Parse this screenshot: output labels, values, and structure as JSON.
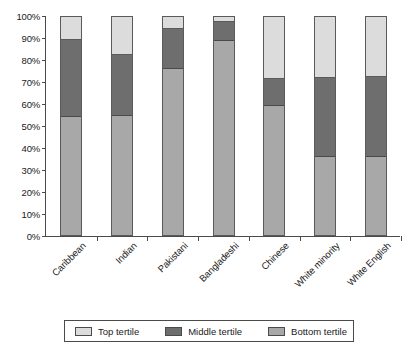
{
  "chart_data": {
    "type": "bar",
    "subtype": "stacked-100-percent",
    "title": "",
    "xlabel": "",
    "ylabel": "",
    "ylim": [
      0,
      100
    ],
    "ytick_labels": [
      "0%",
      "10%",
      "20%",
      "30%",
      "40%",
      "50%",
      "60%",
      "70%",
      "80%",
      "90%",
      "100%"
    ],
    "ytick_values": [
      0,
      10,
      20,
      30,
      40,
      50,
      60,
      70,
      80,
      90,
      100
    ],
    "grid": false,
    "legend_position": "bottom",
    "categories": [
      "Caribbean",
      "Indian",
      "Pakistani",
      "Bangladeshi",
      "Chinese",
      "White minority",
      "White English"
    ],
    "series": [
      {
        "name": "Bottom tertile",
        "color": "#a8a8a8",
        "values": [
          54,
          54.5,
          76,
          89,
          59,
          36,
          36
        ]
      },
      {
        "name": "Middle tertile",
        "color": "#6e6e6e",
        "values": [
          36,
          28.5,
          19,
          9,
          13,
          36.5,
          37
        ]
      },
      {
        "name": "Top tertile",
        "color": "#dcdcdc",
        "values": [
          10,
          17,
          5,
          2,
          28,
          27.5,
          27
        ]
      }
    ],
    "legend": [
      {
        "label": "Top tertile",
        "color": "#dcdcdc"
      },
      {
        "label": "Middle tertile",
        "color": "#6e6e6e"
      },
      {
        "label": "Bottom tertile",
        "color": "#a8a8a8"
      }
    ]
  }
}
